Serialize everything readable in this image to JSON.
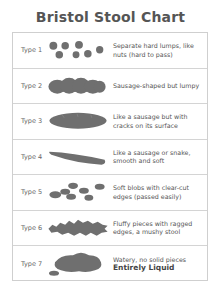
{
  "title": "Bristol Stool Chart",
  "rows": [
    {
      "type": "Type 1",
      "description": "Separate hard lumps, like nuts (hard to pass)",
      "emphasis": ""
    },
    {
      "type": "Type 2",
      "description": "Sausage-shaped but lumpy",
      "emphasis": ""
    },
    {
      "type": "Type 3",
      "description": "Like a sausage but with cracks on its surface",
      "emphasis": ""
    },
    {
      "type": "Type 4",
      "description": "Like a sausage or snake, smooth and soft",
      "emphasis": ""
    },
    {
      "type": "Type 5",
      "description": "Soft blobs with clear-cut edges (passed easily)",
      "emphasis": ""
    },
    {
      "type": "Type 6",
      "description": "Fluffy pieces with ragged edges, a mushy stool",
      "emphasis": ""
    },
    {
      "type": "Type 7",
      "description": "Watery, no solid pieces",
      "emphasis": "Entirely Liquid"
    }
  ],
  "colors": {
    "illustration": "#6f6f6f"
  }
}
